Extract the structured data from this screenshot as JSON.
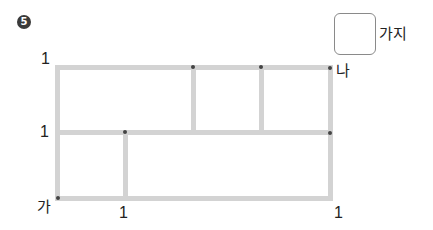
{
  "problem": {
    "number": "5",
    "answer_box": {
      "value": "",
      "unit": "가지"
    }
  },
  "diagram": {
    "type": "grid-paths",
    "start_label": "가",
    "end_label": "나",
    "edge_labels": {
      "left_top": "1",
      "left_middle": "1",
      "bottom_middle": "1",
      "bottom_right": "1"
    },
    "line_color": "#d3d3d3",
    "dot_color": "#444444"
  }
}
